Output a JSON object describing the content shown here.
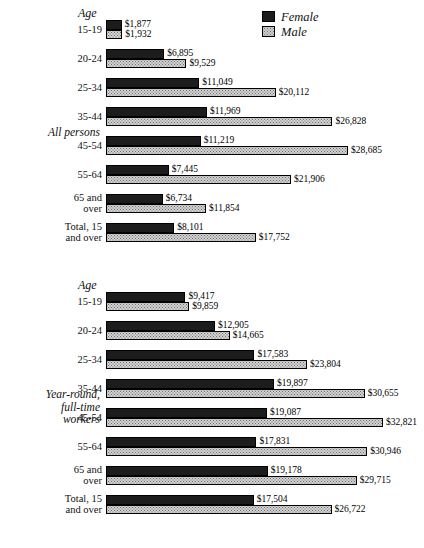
{
  "legend": {
    "items": [
      {
        "label": "Female",
        "swatch": "female-solid-dark",
        "color": "#1c1c1c"
      },
      {
        "label": "Male",
        "swatch": "male-stippled-light",
        "color": "#d2d2d2"
      }
    ]
  },
  "groups": [
    {
      "title_lines": [
        "All persons"
      ],
      "age_header": "Age",
      "rows": [
        {
          "label_lines": [
            "15-19"
          ],
          "female": {
            "value": 1877,
            "label": "$1,877"
          },
          "male": {
            "value": 1932,
            "label": "$1,932"
          }
        },
        {
          "label_lines": [
            "20-24"
          ],
          "female": {
            "value": 6895,
            "label": "$6,895"
          },
          "male": {
            "value": 9529,
            "label": "$9,529"
          }
        },
        {
          "label_lines": [
            "25-34"
          ],
          "female": {
            "value": 11049,
            "label": "$11,049"
          },
          "male": {
            "value": 20112,
            "label": "$20,112"
          }
        },
        {
          "label_lines": [
            "35-44"
          ],
          "female": {
            "value": 11969,
            "label": "$11,969"
          },
          "male": {
            "value": 26828,
            "label": "$26,828"
          }
        },
        {
          "label_lines": [
            "45-54"
          ],
          "female": {
            "value": 11219,
            "label": "$11,219"
          },
          "male": {
            "value": 28685,
            "label": "$28,685"
          }
        },
        {
          "label_lines": [
            "55-64"
          ],
          "female": {
            "value": 7445,
            "label": "$7,445"
          },
          "male": {
            "value": 21906,
            "label": "$21,906"
          }
        },
        {
          "label_lines": [
            "65 and",
            "over"
          ],
          "female": {
            "value": 6734,
            "label": "$6,734"
          },
          "male": {
            "value": 11854,
            "label": "$11,854"
          }
        },
        {
          "label_lines": [
            "Total, 15",
            "and over"
          ],
          "female": {
            "value": 8101,
            "label": "$8,101"
          },
          "male": {
            "value": 17752,
            "label": "$17,752"
          }
        }
      ]
    },
    {
      "title_lines": [
        "Year-round,",
        "full-time",
        "workers"
      ],
      "age_header": "Age",
      "rows": [
        {
          "label_lines": [
            "15-19"
          ],
          "female": {
            "value": 9417,
            "label": "$9,417"
          },
          "male": {
            "value": 9859,
            "label": "$9,859"
          }
        },
        {
          "label_lines": [
            "20-24"
          ],
          "female": {
            "value": 12905,
            "label": "$12,905"
          },
          "male": {
            "value": 14665,
            "label": "$14,665"
          }
        },
        {
          "label_lines": [
            "25-34"
          ],
          "female": {
            "value": 17583,
            "label": "$17,583"
          },
          "male": {
            "value": 23804,
            "label": "$23,804"
          }
        },
        {
          "label_lines": [
            "35-44"
          ],
          "female": {
            "value": 19897,
            "label": "$19,897"
          },
          "male": {
            "value": 30655,
            "label": "$30,655"
          }
        },
        {
          "label_lines": [
            "45-54"
          ],
          "female": {
            "value": 19087,
            "label": "$19,087"
          },
          "male": {
            "value": 32821,
            "label": "$32,821"
          }
        },
        {
          "label_lines": [
            "55-64"
          ],
          "female": {
            "value": 17831,
            "label": "$17,831"
          },
          "male": {
            "value": 30946,
            "label": "$30,946"
          }
        },
        {
          "label_lines": [
            "65 and",
            "over"
          ],
          "female": {
            "value": 19178,
            "label": "$19,178"
          },
          "male": {
            "value": 29715,
            "label": "$29,715"
          }
        },
        {
          "label_lines": [
            "Total, 15",
            "and over"
          ],
          "female": {
            "value": 17504,
            "label": "$17,504"
          },
          "male": {
            "value": 26722,
            "label": "$26,722"
          }
        }
      ]
    }
  ],
  "chart_data": {
    "type": "bar",
    "orientation": "horizontal",
    "title": "",
    "xlabel": "",
    "ylabel": "Age",
    "xlim": [
      0,
      32821
    ],
    "grid": false,
    "legend_position": "top-right",
    "legend": [
      "Female",
      "Male"
    ],
    "value_prefix": "$",
    "panels": [
      {
        "name": "All persons",
        "categories": [
          "15-19",
          "20-24",
          "25-34",
          "35-44",
          "45-54",
          "55-64",
          "65 and over",
          "Total, 15 and over"
        ],
        "series": [
          {
            "name": "Female",
            "values": [
              1877,
              6895,
              11049,
              11969,
              11219,
              7445,
              6734,
              8101
            ]
          },
          {
            "name": "Male",
            "values": [
              1932,
              9529,
              20112,
              26828,
              28685,
              21906,
              11854,
              17752
            ]
          }
        ]
      },
      {
        "name": "Year-round, full-time workers",
        "categories": [
          "15-19",
          "20-24",
          "25-34",
          "35-44",
          "45-54",
          "55-64",
          "65 and over",
          "Total, 15 and over"
        ],
        "series": [
          {
            "name": "Female",
            "values": [
              9417,
              12905,
              17583,
              19897,
              19087,
              17831,
              19178,
              17504
            ]
          },
          {
            "name": "Male",
            "values": [
              9859,
              14665,
              23804,
              30655,
              32821,
              30946,
              29715,
              26722
            ]
          }
        ]
      }
    ]
  }
}
